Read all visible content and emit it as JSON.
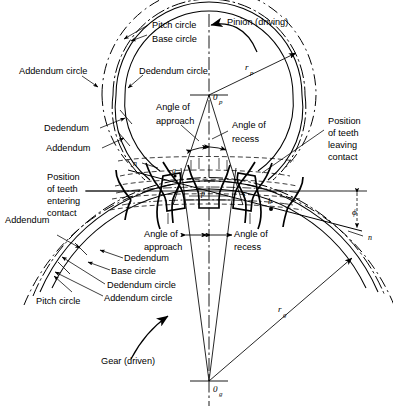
{
  "figure": {
    "type": "engineering-line-diagram",
    "background": "#ffffff",
    "line_color": "#000000",
    "width": 393,
    "height": 414
  },
  "labels": {
    "pitch_circle_top": "Pitch circle",
    "base_circle_top": "Base circle",
    "addendum_circle_top_left": "Addendum circle",
    "dedendum_circle_top": "Dedendum circle",
    "pinion_driving": "Pinion (driving)",
    "angle_of_approach_top": "Angle of\napproach",
    "angle_of_approach_top_l1": "Angle of",
    "angle_of_approach_top_l2": "approach",
    "angle_of_recess_top_l1": "Angle of",
    "angle_of_recess_top_l2": "recess",
    "dedendum_left": "Dedendum",
    "addendum_left": "Addendum",
    "position_entering_l1": "Position",
    "position_entering_l2": "of teeth",
    "position_entering_l3": "entering",
    "position_entering_l4": "contact",
    "position_leaving_l1": "Position",
    "position_leaving_l2": "of teeth",
    "position_leaving_l3": "leaving",
    "position_leaving_l4": "contact",
    "addendum_lower_left": "Addendum",
    "dedendum_lower": "Dedendum",
    "base_circle_lower": "Base circle",
    "dedendum_circle_lower": "Dedendum circle",
    "addendum_circle_lower": "Addendum circle",
    "pitch_circle_lower": "Pitch circle",
    "angle_of_approach_bottom_l1": "Angle of",
    "angle_of_approach_bottom_l2": "approach",
    "angle_of_recess_bottom_l1": "Angle of",
    "angle_of_recess_bottom_l2": "recess",
    "gear_driven": "Gear (driven)"
  },
  "symbols": {
    "pinion_center": "0",
    "pinion_center_sub": "p",
    "gear_center": "0",
    "gear_center_sub": "g",
    "pinion_radius": "r",
    "pinion_radius_sub": "p",
    "gear_radius": "r",
    "gear_radius_sub": "g",
    "pressure_angle": "ϕ",
    "line_of_action_left": "n",
    "line_of_action_right": "n",
    "point_a": "a",
    "point_b": "b",
    "point_c": "c",
    "pitch_point": "p"
  },
  "geometry": {
    "pinion_center_x": 209,
    "pinion_center_y": 95,
    "gear_center_x": 209,
    "gear_center_y": 381,
    "pitch_point_x": 208,
    "pitch_point_y": 191,
    "pinion_pitch_radius": 96,
    "gear_pitch_radius": 190,
    "pressure_angle_deg": 14.5,
    "pitch_line_x_start": 85,
    "pitch_line_x_end": 367
  }
}
